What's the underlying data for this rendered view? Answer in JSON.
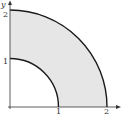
{
  "diagram": {
    "type": "quarter-annulus region",
    "inner_radius": 1,
    "outer_radius": 2,
    "region_fill": "#e6e6e6",
    "stroke_color": "#1a1a1a",
    "axes": {
      "x_label": "x",
      "y_label": "y",
      "x_ticks": [
        "1",
        "2"
      ],
      "y_ticks": [
        "1",
        "2"
      ]
    }
  }
}
